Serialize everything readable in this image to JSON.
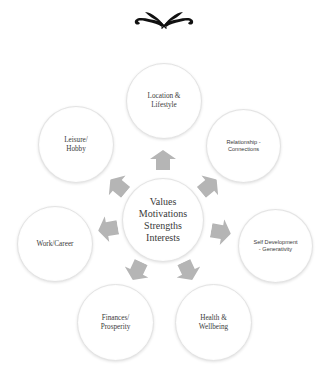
{
  "diagram": {
    "type": "hub-and-spoke",
    "ornament": "floral-divider-icon",
    "colors": {
      "circle_fill": "#ffffff",
      "circle_border": "#e3e3e3",
      "arrow_fill": "#b5b5b5",
      "text": "#3a3a3a",
      "ornament": "#111111"
    },
    "center": {
      "label": "Values\nMotivations\nStrengths\nInterests"
    },
    "nodes": [
      {
        "id": "location",
        "label": "Location &\nLifestyle"
      },
      {
        "id": "relationship",
        "label": "Relationship -\nConnections"
      },
      {
        "id": "self-development",
        "label": "Self Development\n- Generativity"
      },
      {
        "id": "health",
        "label": "Health &\nWellbeing"
      },
      {
        "id": "finances",
        "label": "Finances/\nProsperity"
      },
      {
        "id": "work",
        "label": "Work/Career"
      },
      {
        "id": "leisure",
        "label": "Leisure/\nHobby"
      }
    ],
    "arrows": [
      {
        "to": "location",
        "icon": "arrow-up-icon"
      },
      {
        "to": "relationship",
        "icon": "arrow-upper-right-icon"
      },
      {
        "to": "self-development",
        "icon": "arrow-right-icon"
      },
      {
        "to": "health",
        "icon": "arrow-lower-right-icon"
      },
      {
        "to": "finances",
        "icon": "arrow-lower-left-icon"
      },
      {
        "to": "work",
        "icon": "arrow-left-icon"
      },
      {
        "to": "leisure",
        "icon": "arrow-upper-left-icon"
      }
    ]
  }
}
